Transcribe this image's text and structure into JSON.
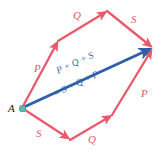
{
  "figure": {
    "background_color": "#ffffff",
    "vector_color": "#e8596b",
    "resultant_color": "#2f5fa8",
    "node_color": "#5fb8a8",
    "label_color_dark": "#1a1a1a"
  },
  "points": {
    "start_label": "A",
    "start_x": 22,
    "start_y": 108,
    "end_x": 152,
    "end_y": 48
  },
  "upper_path": {
    "description": "Upper route from A to endpoint: P then Q then S",
    "segments": [
      {
        "label": "P",
        "label_x": 34,
        "label_y": 63,
        "from_x": 22,
        "from_y": 108,
        "to_x": 58,
        "to_y": 41
      },
      {
        "label": "Q",
        "label_x": 73,
        "label_y": 10,
        "from_x": 58,
        "from_y": 41,
        "to_x": 107,
        "to_y": 11
      },
      {
        "label": "S",
        "label_x": 131,
        "label_y": 14,
        "from_x": 107,
        "from_y": 11,
        "to_x": 152,
        "to_y": 48
      }
    ]
  },
  "lower_path": {
    "description": "Lower route from A to endpoint: S then Q then P",
    "segments": [
      {
        "label": "S",
        "label_x": 36,
        "label_y": 128,
        "from_x": 22,
        "from_y": 108,
        "to_x": 70,
        "to_y": 140
      },
      {
        "label": "Q",
        "label_x": 88,
        "label_y": 134,
        "from_x": 70,
        "from_y": 140,
        "to_x": 112,
        "to_y": 115
      },
      {
        "label": "P",
        "label_x": 141,
        "label_y": 88,
        "from_x": 112,
        "from_y": 115,
        "to_x": 152,
        "to_y": 48
      }
    ]
  },
  "resultant": {
    "line_1": "P + Q + S",
    "line_2": "= S + Q + P",
    "from_x": 22,
    "from_y": 108,
    "to_x": 152,
    "to_y": 48,
    "text_x": 58,
    "text_y": 88,
    "text_rotation_deg": -24.8
  }
}
